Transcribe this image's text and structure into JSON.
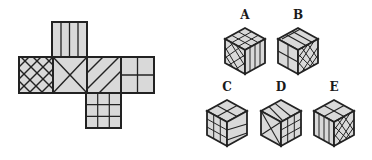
{
  "puzzle": {
    "type": "cube-net-folding",
    "net": {
      "faces": [
        {
          "id": "top",
          "pattern": "vertical-lines"
        },
        {
          "id": "left",
          "pattern": "diagonal-crosshatch"
        },
        {
          "id": "center",
          "pattern": "x-cross"
        },
        {
          "id": "middle-right",
          "pattern": "diagonal-lines"
        },
        {
          "id": "far-right",
          "pattern": "quarter-grid"
        },
        {
          "id": "bottom",
          "pattern": "3x3-grid"
        }
      ]
    },
    "options": [
      {
        "label": "A",
        "top": "3x3-grid",
        "left": "diagonal-crosshatch",
        "right": "vertical-lines"
      },
      {
        "label": "B",
        "top": "diagonal-lines",
        "left": "quarter-grid",
        "right": "diagonal-crosshatch"
      },
      {
        "label": "C",
        "top": "x-cross",
        "left": "3x3-grid",
        "right": "diagonal-lines"
      },
      {
        "label": "D",
        "top": "diagonal-lines",
        "left": "x-cross",
        "right": "3x3-grid"
      },
      {
        "label": "E",
        "top": "x-cross",
        "left": "vertical-lines",
        "right": "diagonal-crosshatch"
      }
    ]
  },
  "colors": {
    "face_fill": "#d9d9d9",
    "stroke": "#222222",
    "background": "#ffffff"
  }
}
